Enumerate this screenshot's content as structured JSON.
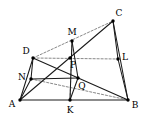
{
  "figure": {
    "type": "geometry-diagram",
    "title": "",
    "width": 144,
    "height": 123,
    "background": "#ffffff",
    "stroke_color": "#1a1a1a",
    "dash_color": "#555555",
    "point_color": "#000000",
    "points": [
      {
        "id": "A",
        "label": "A",
        "x": 20,
        "y": 100,
        "label_x": 12,
        "label_y": 104,
        "dot": true
      },
      {
        "id": "B",
        "label": "B",
        "x": 128,
        "y": 100,
        "label_x": 135,
        "label_y": 105,
        "dot": true
      },
      {
        "id": "C",
        "label": "C",
        "x": 113,
        "y": 21,
        "label_x": 119,
        "label_y": 13,
        "dot": true
      },
      {
        "id": "D",
        "label": "D",
        "x": 33,
        "y": 58,
        "label_x": 26,
        "label_y": 51,
        "dot": true
      },
      {
        "id": "N",
        "label": "N",
        "x": 31,
        "y": 79,
        "label_x": 22,
        "label_y": 77,
        "dot": true
      },
      {
        "id": "M",
        "label": "M",
        "x": 72,
        "y": 41,
        "label_x": 72,
        "label_y": 32,
        "dot": true
      },
      {
        "id": "P",
        "label": "P",
        "x": 70,
        "y": 58,
        "label_x": 73,
        "label_y": 65,
        "dot": true
      },
      {
        "id": "Q",
        "label": "Q",
        "x": 78,
        "y": 78,
        "label_x": 82,
        "label_y": 86,
        "dot": true
      },
      {
        "id": "K",
        "label": "K",
        "x": 70,
        "y": 100,
        "label_x": 70,
        "label_y": 110,
        "dot": true
      },
      {
        "id": "L",
        "label": "L",
        "x": 118,
        "y": 59,
        "label_x": 125,
        "label_y": 57,
        "dot": true
      }
    ],
    "solid_segments": [
      {
        "name": "side-AB",
        "from": "A",
        "to": "B"
      },
      {
        "name": "side-BC",
        "from": "B",
        "to": "C"
      },
      {
        "name": "cevian-A-to-C",
        "from": "A",
        "to": "C"
      },
      {
        "name": "segment-A-D",
        "from": "A",
        "to": "D"
      },
      {
        "name": "segment-D-N",
        "from": "D",
        "to": "N"
      },
      {
        "name": "segment-N-A",
        "from": "N",
        "to": "A"
      },
      {
        "name": "segment-D-Q-B",
        "from": "D",
        "to": "B"
      },
      {
        "name": "segment-M-K",
        "from": "M",
        "to": "K"
      },
      {
        "name": "segment-M-Q",
        "from": "M",
        "to": "Q"
      },
      {
        "name": "segment-Q-K",
        "from": "Q",
        "to": "K"
      },
      {
        "name": "segment-C-L",
        "from": "C",
        "to": "L"
      },
      {
        "name": "segment-L-B",
        "from": "L",
        "to": "B"
      },
      {
        "name": "segment-N-Q",
        "from": "N",
        "to": "Q"
      }
    ],
    "dashed_segments": [
      {
        "name": "dashed-D-M-C",
        "from": "D",
        "to": "C"
      },
      {
        "name": "dashed-D-P-L",
        "from": "D",
        "to": "L"
      },
      {
        "name": "dashed-N-K-B",
        "from": "N",
        "to": "B"
      },
      {
        "name": "dashed-M-P-K",
        "from": "M",
        "to": "K"
      }
    ]
  }
}
